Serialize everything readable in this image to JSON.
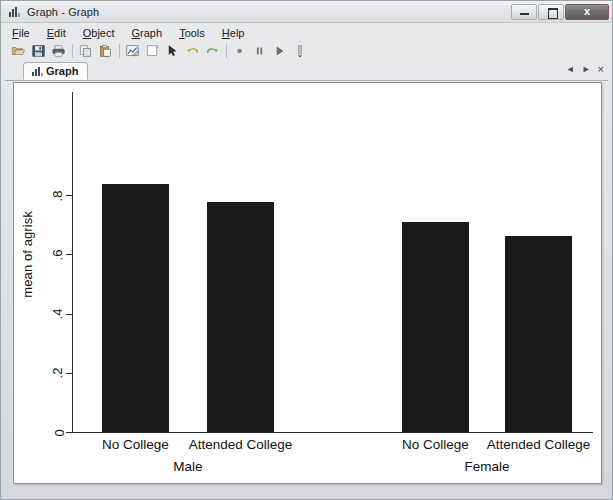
{
  "window": {
    "title": "Graph - Graph",
    "icon": "bar-chart-icon",
    "buttons": {
      "minimize": "minimize-icon",
      "maximize": "maximize-icon",
      "close": "x"
    }
  },
  "menu": {
    "items": [
      {
        "label": "File",
        "accel": "F"
      },
      {
        "label": "Edit",
        "accel": "E"
      },
      {
        "label": "Object",
        "accel": "O"
      },
      {
        "label": "Graph",
        "accel": "G"
      },
      {
        "label": "Tools",
        "accel": "T"
      },
      {
        "label": "Help",
        "accel": "H"
      }
    ]
  },
  "toolbar": {
    "buttons": [
      {
        "name": "open-icon"
      },
      {
        "name": "save-icon"
      },
      {
        "name": "print-icon"
      },
      {
        "name": "separator"
      },
      {
        "name": "copy-icon"
      },
      {
        "name": "paste-icon"
      },
      {
        "name": "separator"
      },
      {
        "name": "graph-editor-icon"
      },
      {
        "name": "new-graph-icon"
      },
      {
        "name": "pointer-icon"
      },
      {
        "name": "undo-icon"
      },
      {
        "name": "redo-icon"
      },
      {
        "name": "separator"
      },
      {
        "name": "record-icon"
      },
      {
        "name": "pause-icon"
      },
      {
        "name": "play-icon"
      },
      {
        "name": "more-icon"
      }
    ]
  },
  "tabs": {
    "active": "Graph",
    "items": [
      {
        "label": "Graph",
        "icon": "bar-chart-icon"
      }
    ],
    "nav": {
      "prev": "◄",
      "next": "►",
      "close": "×"
    }
  },
  "chart_data": {
    "type": "bar",
    "title": "",
    "xlabel": "",
    "ylabel": "mean of agrisk",
    "ylim": [
      0,
      0.88
    ],
    "yticks": [
      0,
      0.2,
      0.4,
      0.6,
      0.8
    ],
    "ytick_labels": [
      "0",
      ".2",
      ".4",
      ".6",
      ".8"
    ],
    "grid": false,
    "legend": null,
    "groups": [
      {
        "label": "Male",
        "categories": [
          "No College",
          "Attended College"
        ],
        "values": [
          0.836,
          0.778
        ]
      },
      {
        "label": "Female",
        "categories": [
          "No College",
          "Attended College"
        ],
        "values": [
          0.71,
          0.66
        ]
      }
    ],
    "categories": [
      "No College",
      "Attended College",
      "No College",
      "Attended College"
    ],
    "values": [
      0.836,
      0.778,
      0.71,
      0.66
    ],
    "bar_color": "#1a1a1a"
  }
}
